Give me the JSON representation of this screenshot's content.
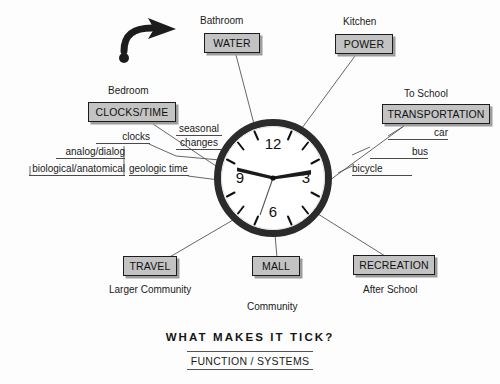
{
  "diagram": {
    "title": "WHAT MAKES IT TICK?",
    "subtitle": "FUNCTION / SYSTEMS",
    "background_color": "#fdfdfd",
    "node_fill_color": "#c3c3c3",
    "node_border_color": "#1c1c1c",
    "line_color": "#4a4a4a",
    "clock": {
      "name": "analog-wall-clock",
      "ring_color": "#2a2a2a",
      "face_color": "#ffffff",
      "hour_numbers": [
        "12",
        "3",
        "6",
        "9"
      ],
      "displayed_time": "1:50",
      "hand_labels": {
        "hour": "hour-hand",
        "minute": "minute-hand",
        "second": "second-hand"
      }
    },
    "arrow": {
      "name": "curved-pointer-arrow",
      "color": "#1c1c1c"
    },
    "nodes": [
      {
        "id": "water",
        "label": "WATER",
        "caption": "Bathroom"
      },
      {
        "id": "power",
        "label": "POWER",
        "caption": "Kitchen"
      },
      {
        "id": "transportation",
        "label": "TRANSPORTATION",
        "caption": "To School"
      },
      {
        "id": "clocks-time",
        "label": "CLOCKS/TIME",
        "caption": "Bedroom"
      },
      {
        "id": "travel",
        "label": "TRAVEL",
        "caption": "Larger Community"
      },
      {
        "id": "mall",
        "label": "MALL",
        "caption": "Community"
      },
      {
        "id": "recreation",
        "label": "RECREATION",
        "caption": "After School"
      }
    ],
    "sub_labels": [
      {
        "id": "seasonal-changes",
        "text_line_1": "seasonal",
        "text_line_2": "changes"
      },
      {
        "id": "clocks",
        "text": "clocks"
      },
      {
        "id": "analog-dialog",
        "text": "analog/dialog"
      },
      {
        "id": "biological-anatomical",
        "text": "biological/anatomical"
      },
      {
        "id": "geologic-time",
        "text": "geologic time"
      },
      {
        "id": "car",
        "text": "car"
      },
      {
        "id": "bus",
        "text": "bus"
      },
      {
        "id": "bicycle",
        "text": "bicycle"
      }
    ]
  }
}
